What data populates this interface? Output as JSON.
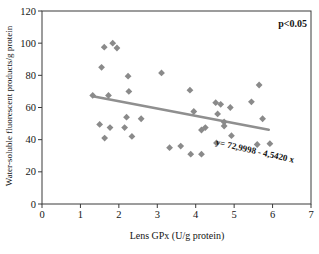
{
  "chart_data": {
    "type": "scatter",
    "title": "",
    "xlabel": "Lens GPx (U/g protein)",
    "ylabel": "Water-soluble fluorescent products/g protein",
    "xlim": [
      0,
      7
    ],
    "ylim": [
      0,
      120
    ],
    "x_ticks": [
      "0",
      "1",
      "2",
      "3",
      "4",
      "5",
      "6",
      "7"
    ],
    "y_ticks": [
      "0",
      "20",
      "40",
      "60",
      "80",
      "100",
      "120"
    ],
    "grid": false,
    "legend_position": "none",
    "annotation": "p<0.05",
    "equation_label": "y= 72,9998 - 4,5420 x",
    "trendline": {
      "intercept": 72.9998,
      "slope": -4.542,
      "x_start": 1.32,
      "x_end": 5.9
    },
    "points": [
      [
        1.32,
        67.5
      ],
      [
        1.5,
        49.5
      ],
      [
        1.55,
        85
      ],
      [
        1.62,
        97.5
      ],
      [
        1.63,
        41
      ],
      [
        1.73,
        67.5
      ],
      [
        1.77,
        47.5
      ],
      [
        1.84,
        100
      ],
      [
        1.95,
        97
      ],
      [
        2.15,
        47.5
      ],
      [
        2.2,
        54
      ],
      [
        2.24,
        79.5
      ],
      [
        2.26,
        70
      ],
      [
        2.34,
        42
      ],
      [
        2.58,
        53
      ],
      [
        3.11,
        81.5
      ],
      [
        3.32,
        35
      ],
      [
        3.61,
        36
      ],
      [
        3.85,
        70.8
      ],
      [
        3.87,
        31
      ],
      [
        3.95,
        57.5
      ],
      [
        4.15,
        31
      ],
      [
        4.15,
        46
      ],
      [
        4.25,
        47.5
      ],
      [
        4.52,
        63
      ],
      [
        4.54,
        38
      ],
      [
        4.57,
        56
      ],
      [
        4.65,
        62
      ],
      [
        4.74,
        51
      ],
      [
        4.74,
        48.5
      ],
      [
        4.9,
        60
      ],
      [
        4.93,
        42.5
      ],
      [
        5.45,
        63.5
      ],
      [
        5.6,
        37
      ],
      [
        5.65,
        74
      ],
      [
        5.74,
        53
      ],
      [
        5.93,
        37.5
      ]
    ],
    "marker_color": "#8a8a8a",
    "line_color": "#8f8f8f",
    "axis_color": "#3a3a3a",
    "text_color": "#141414",
    "background_color": "#ffffff"
  }
}
